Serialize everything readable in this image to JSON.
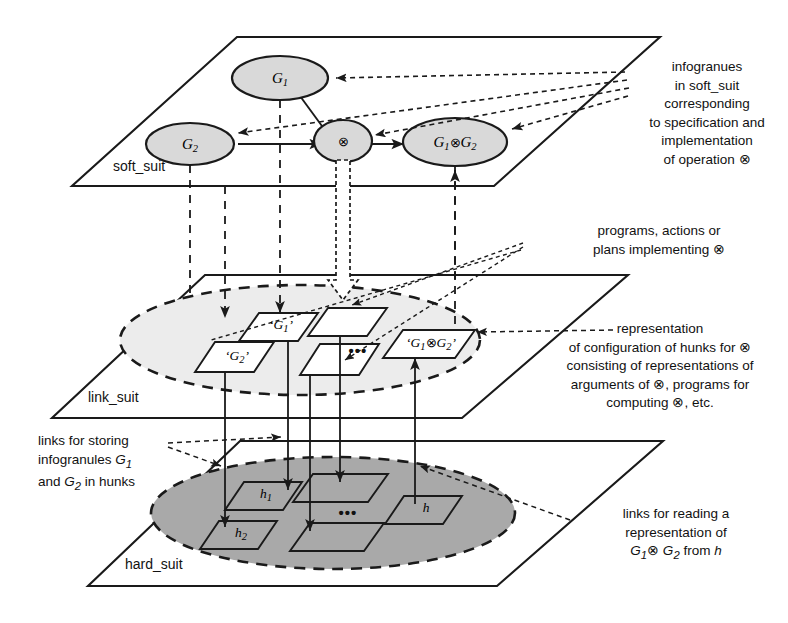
{
  "figure": {
    "operation_symbol": "⊗"
  },
  "planes": [
    {
      "id": "soft",
      "label": "soft_suit",
      "fill": "#ffffff"
    },
    {
      "id": "link",
      "label": "link_suit",
      "fill": "#ffffff"
    },
    {
      "id": "hard",
      "label": "hard_suit",
      "fill": "#ffffff"
    }
  ],
  "soft_suit": {
    "label": "soft_suit",
    "nodes": [
      {
        "id": "g1",
        "text": "G",
        "sub": "1",
        "kind": "ellipse",
        "fill": "#d9d9d9"
      },
      {
        "id": "g2",
        "text": "G",
        "sub": "2",
        "kind": "ellipse",
        "fill": "#d9d9d9"
      },
      {
        "id": "op",
        "text": "⊗",
        "sub": "",
        "kind": "ellipse",
        "fill": "#d9d9d9"
      },
      {
        "id": "g1g2",
        "text": "G1⊗G2",
        "sub": "",
        "kind": "ellipse",
        "fill": "#d9d9d9"
      }
    ]
  },
  "link_suit": {
    "label": "link_suit",
    "region_fill": "#ececec",
    "hunks": [
      {
        "id": "lg1",
        "label": "‘G1’"
      },
      {
        "id": "lg2",
        "label": "‘G2’"
      },
      {
        "id": "lp1",
        "label": ""
      },
      {
        "id": "lp2",
        "label": ""
      },
      {
        "id": "lg1g2",
        "label": "‘G1⊗G2’"
      }
    ],
    "ellipsis": "•••"
  },
  "hard_suit": {
    "label": "hard_suit",
    "region_fill": "#a9a9a9",
    "hunks": [
      {
        "id": "h1",
        "label": "h",
        "sub": "1"
      },
      {
        "id": "h2",
        "label": "h",
        "sub": "2"
      },
      {
        "id": "hp1",
        "label": "",
        "sub": ""
      },
      {
        "id": "hp2",
        "label": "",
        "sub": ""
      },
      {
        "id": "h",
        "label": "h",
        "sub": ""
      }
    ],
    "ellipsis": "•••"
  },
  "annotations": {
    "top_right": "infogranues\nin soft_suit\ncorresponding\nto specification and\nimplementation\nof operation ⊗",
    "mid_right_upper": "programs, actions or\nplans implementing  ⊗",
    "mid_right_lower": "representation\nof configuration of hunks  for ⊗\nconsisting of representations of\narguments of ⊗, programs for\ncomputing ⊗, etc.",
    "left_lower": "links for storing\ninfogranules G1\nand G2 in hunks",
    "bottom_right": "links for reading a\nrepresentation of\nG1⊗G2 from h"
  },
  "node_labels": {
    "g1": "G1",
    "g2": "G2",
    "op": "⊗",
    "g1g2": "G1⊗G2",
    "lg1": "‘G1’",
    "lg2": "‘G2’",
    "lg1g2": "‘G1⊗G2’",
    "h1": "h1",
    "h2": "h2",
    "h": "h"
  },
  "colors": {
    "stroke": "#1a1a1a",
    "soft_node_fill": "#d9d9d9",
    "link_region_fill": "#ececec",
    "hard_region_fill": "#a9a9a9",
    "hunk_fill": "#ffffff",
    "background": "#ffffff"
  }
}
